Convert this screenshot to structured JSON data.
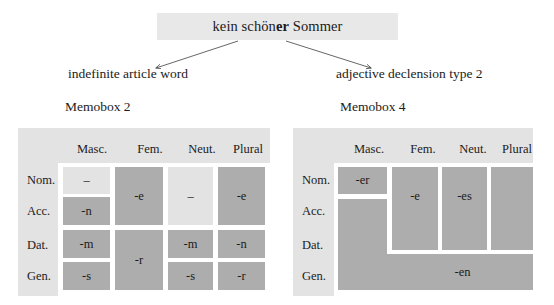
{
  "title": {
    "phrase_part1": "kein schön",
    "phrase_bold": "er",
    "phrase_part2": " Sommer",
    "full": "kein schöner Sommer",
    "background": "#e8e8e8"
  },
  "branches": {
    "left_label": "indefinite article word",
    "right_label": "adjective declension type 2",
    "arrow_color": "#555555"
  },
  "colors": {
    "table_background": "#e3e3e3",
    "cell_dark": "#adadad",
    "cell_light": "#e3e3e3",
    "gutter": "#ffffff",
    "text": "#1b1b1b"
  },
  "memobox_left": {
    "caption": "Memobox 2",
    "column_headers": [
      "Masc.",
      "Fem.",
      "Neut.",
      "Plural"
    ],
    "row_headers": [
      "Nom.",
      "Acc.",
      "Dat.",
      "Gen."
    ],
    "cells": [
      {
        "name": "nom-masc",
        "text": "–",
        "shade": "light"
      },
      {
        "name": "acc-masc",
        "text": "-n",
        "shade": "dark"
      },
      {
        "name": "nomacc-fem",
        "text": "-e",
        "shade": "dark"
      },
      {
        "name": "nomacc-neut",
        "text": "–",
        "shade": "light"
      },
      {
        "name": "nomacc-plur",
        "text": "-e",
        "shade": "dark"
      },
      {
        "name": "dat-masc",
        "text": "-m",
        "shade": "dark"
      },
      {
        "name": "datgen-fem",
        "text": "-r",
        "shade": "dark"
      },
      {
        "name": "dat-neut",
        "text": "-m",
        "shade": "dark"
      },
      {
        "name": "dat-plur",
        "text": "-n",
        "shade": "dark"
      },
      {
        "name": "gen-masc",
        "text": "-s",
        "shade": "dark"
      },
      {
        "name": "gen-neut",
        "text": "-s",
        "shade": "dark"
      },
      {
        "name": "gen-plur",
        "text": "-r",
        "shade": "dark"
      }
    ]
  },
  "memobox_right": {
    "caption": "Memobox 4",
    "column_headers": [
      "Masc.",
      "Fem.",
      "Neut.",
      "Plural"
    ],
    "row_headers": [
      "Nom.",
      "Acc.",
      "Dat.",
      "Gen."
    ],
    "cells": [
      {
        "name": "nom-masc",
        "text": "-er",
        "shade": "dark"
      },
      {
        "name": "nomacc-fem",
        "text": "-e",
        "shade": "dark"
      },
      {
        "name": "nomacc-neut",
        "text": "-es",
        "shade": "dark"
      },
      {
        "name": "nomacc-plur",
        "text": "",
        "shade": "dark"
      },
      {
        "name": "acc-masc",
        "text": "",
        "shade": "dark"
      },
      {
        "name": "rest-en",
        "text": "-en",
        "shade": "dark"
      }
    ]
  }
}
